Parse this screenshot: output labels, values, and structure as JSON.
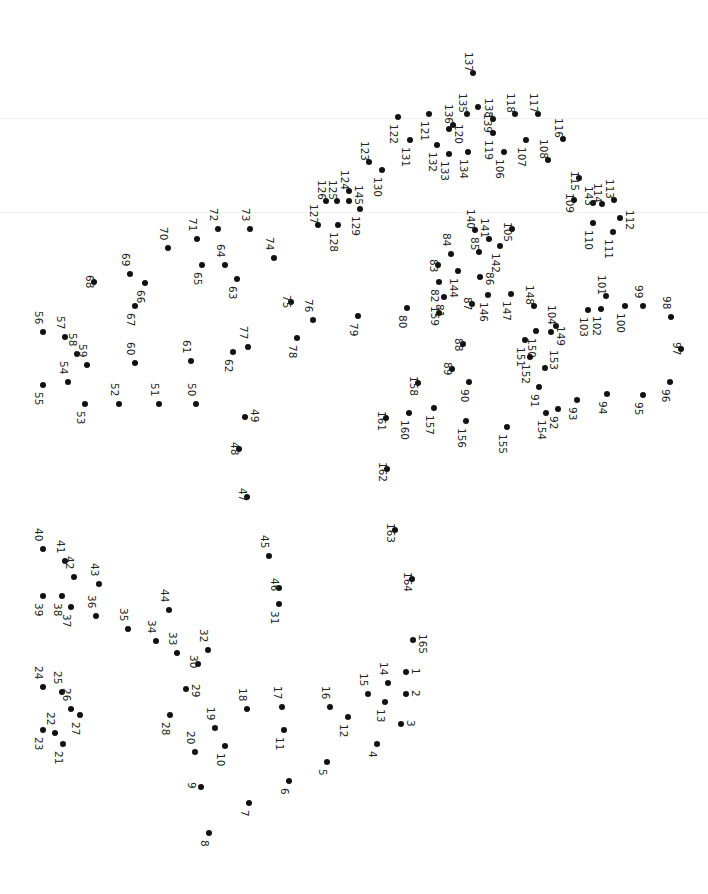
{
  "puzzle": {
    "type": "connect-the-dots",
    "orientation": "rotated-90",
    "dot_color": "#111111",
    "label_color": "#222222",
    "total_dots": 165,
    "dots": [
      {
        "n": 1,
        "x": 406,
        "y": 672,
        "lx": 412,
        "ly": 668
      },
      {
        "n": 2,
        "x": 406,
        "y": 694,
        "lx": 412,
        "ly": 690
      },
      {
        "n": 3,
        "x": 401,
        "y": 724,
        "lx": 407,
        "ly": 720
      },
      {
        "n": 4,
        "x": 377,
        "y": 744,
        "lx": 369,
        "ly": 751
      },
      {
        "n": 5,
        "x": 327,
        "y": 762,
        "lx": 319,
        "ly": 769
      },
      {
        "n": 6,
        "x": 289,
        "y": 781,
        "lx": 281,
        "ly": 788
      },
      {
        "n": 7,
        "x": 249,
        "y": 803,
        "lx": 241,
        "ly": 810
      },
      {
        "n": 8,
        "x": 209,
        "y": 833,
        "lx": 201,
        "ly": 840
      },
      {
        "n": 9,
        "x": 201,
        "y": 787,
        "lx": 188,
        "ly": 782
      },
      {
        "n": 10,
        "x": 225,
        "y": 746,
        "lx": 217,
        "ly": 753
      },
      {
        "n": 11,
        "x": 284,
        "y": 730,
        "lx": 276,
        "ly": 737
      },
      {
        "n": 12,
        "x": 348,
        "y": 717,
        "lx": 340,
        "ly": 724
      },
      {
        "n": 13,
        "x": 385,
        "y": 702,
        "lx": 377,
        "ly": 709
      },
      {
        "n": 14,
        "x": 388,
        "y": 683,
        "lx": 380,
        "ly": 662
      },
      {
        "n": 15,
        "x": 368,
        "y": 694,
        "lx": 360,
        "ly": 673
      },
      {
        "n": 16,
        "x": 330,
        "y": 707,
        "lx": 322,
        "ly": 686
      },
      {
        "n": 17,
        "x": 282,
        "y": 707,
        "lx": 274,
        "ly": 686
      },
      {
        "n": 18,
        "x": 247,
        "y": 709,
        "lx": 239,
        "ly": 688
      },
      {
        "n": 19,
        "x": 215,
        "y": 728,
        "lx": 207,
        "ly": 707
      },
      {
        "n": 20,
        "x": 195,
        "y": 752,
        "lx": 187,
        "ly": 731
      },
      {
        "n": 21,
        "x": 63,
        "y": 744,
        "lx": 55,
        "ly": 751
      },
      {
        "n": 22,
        "x": 55,
        "y": 733,
        "lx": 47,
        "ly": 712
      },
      {
        "n": 23,
        "x": 43,
        "y": 730,
        "lx": 35,
        "ly": 737
      },
      {
        "n": 24,
        "x": 43,
        "y": 687,
        "lx": 35,
        "ly": 666
      },
      {
        "n": 25,
        "x": 62,
        "y": 692,
        "lx": 54,
        "ly": 671
      },
      {
        "n": 26,
        "x": 71,
        "y": 709,
        "lx": 63,
        "ly": 688
      },
      {
        "n": 27,
        "x": 80,
        "y": 715,
        "lx": 72,
        "ly": 722
      },
      {
        "n": 28,
        "x": 170,
        "y": 715,
        "lx": 162,
        "ly": 722
      },
      {
        "n": 29,
        "x": 186,
        "y": 689,
        "lx": 192,
        "ly": 684
      },
      {
        "n": 30,
        "x": 198,
        "y": 664,
        "lx": 190,
        "ly": 655
      },
      {
        "n": 31,
        "x": 279,
        "y": 604,
        "lx": 271,
        "ly": 611
      },
      {
        "n": 32,
        "x": 208,
        "y": 650,
        "lx": 200,
        "ly": 629
      },
      {
        "n": 33,
        "x": 177,
        "y": 653,
        "lx": 169,
        "ly": 632
      },
      {
        "n": 34,
        "x": 156,
        "y": 641,
        "lx": 148,
        "ly": 620
      },
      {
        "n": 35,
        "x": 128,
        "y": 629,
        "lx": 120,
        "ly": 608
      },
      {
        "n": 36,
        "x": 96,
        "y": 616,
        "lx": 88,
        "ly": 595
      },
      {
        "n": 37,
        "x": 71,
        "y": 607,
        "lx": 63,
        "ly": 614
      },
      {
        "n": 38,
        "x": 62,
        "y": 596,
        "lx": 54,
        "ly": 603
      },
      {
        "n": 39,
        "x": 43,
        "y": 596,
        "lx": 35,
        "ly": 603
      },
      {
        "n": 40,
        "x": 43,
        "y": 549,
        "lx": 35,
        "ly": 528
      },
      {
        "n": 41,
        "x": 65,
        "y": 561,
        "lx": 57,
        "ly": 540
      },
      {
        "n": 42,
        "x": 74,
        "y": 577,
        "lx": 66,
        "ly": 556
      },
      {
        "n": 43,
        "x": 99,
        "y": 584,
        "lx": 91,
        "ly": 563
      },
      {
        "n": 44,
        "x": 169,
        "y": 610,
        "lx": 161,
        "ly": 589
      },
      {
        "n": 45,
        "x": 269,
        "y": 556,
        "lx": 261,
        "ly": 535
      },
      {
        "n": 46,
        "x": 279,
        "y": 588,
        "lx": 271,
        "ly": 578
      },
      {
        "n": 47,
        "x": 247,
        "y": 497,
        "lx": 239,
        "ly": 488
      },
      {
        "n": 48,
        "x": 239,
        "y": 449,
        "lx": 231,
        "ly": 442
      },
      {
        "n": 49,
        "x": 245,
        "y": 417,
        "lx": 251,
        "ly": 409
      },
      {
        "n": 50,
        "x": 196,
        "y": 404,
        "lx": 188,
        "ly": 383
      },
      {
        "n": 51,
        "x": 159,
        "y": 404,
        "lx": 151,
        "ly": 383
      },
      {
        "n": 52,
        "x": 119,
        "y": 404,
        "lx": 111,
        "ly": 383
      },
      {
        "n": 53,
        "x": 85,
        "y": 404,
        "lx": 77,
        "ly": 411
      },
      {
        "n": 54,
        "x": 68,
        "y": 382,
        "lx": 60,
        "ly": 361
      },
      {
        "n": 55,
        "x": 43,
        "y": 385,
        "lx": 35,
        "ly": 392
      },
      {
        "n": 56,
        "x": 43,
        "y": 332,
        "lx": 35,
        "ly": 311
      },
      {
        "n": 57,
        "x": 65,
        "y": 337,
        "lx": 57,
        "ly": 316
      },
      {
        "n": 58,
        "x": 77,
        "y": 354,
        "lx": 69,
        "ly": 333
      },
      {
        "n": 59,
        "x": 87,
        "y": 365,
        "lx": 79,
        "ly": 344
      },
      {
        "n": 60,
        "x": 135,
        "y": 363,
        "lx": 127,
        "ly": 342
      },
      {
        "n": 61,
        "x": 191,
        "y": 361,
        "lx": 183,
        "ly": 340
      },
      {
        "n": 62,
        "x": 233,
        "y": 352,
        "lx": 225,
        "ly": 359
      },
      {
        "n": 63,
        "x": 237,
        "y": 279,
        "lx": 229,
        "ly": 286
      },
      {
        "n": 64,
        "x": 225,
        "y": 265,
        "lx": 217,
        "ly": 244
      },
      {
        "n": 65,
        "x": 202,
        "y": 265,
        "lx": 194,
        "ly": 272
      },
      {
        "n": 66,
        "x": 145,
        "y": 283,
        "lx": 137,
        "ly": 290
      },
      {
        "n": 67,
        "x": 135,
        "y": 306,
        "lx": 127,
        "ly": 313
      },
      {
        "n": 68,
        "x": 94,
        "y": 282,
        "lx": 86,
        "ly": 275
      },
      {
        "n": 69,
        "x": 130,
        "y": 274,
        "lx": 122,
        "ly": 253
      },
      {
        "n": 70,
        "x": 168,
        "y": 248,
        "lx": 160,
        "ly": 227
      },
      {
        "n": 71,
        "x": 197,
        "y": 239,
        "lx": 189,
        "ly": 218
      },
      {
        "n": 72,
        "x": 218,
        "y": 229,
        "lx": 210,
        "ly": 208
      },
      {
        "n": 73,
        "x": 250,
        "y": 229,
        "lx": 242,
        "ly": 208
      },
      {
        "n": 74,
        "x": 274,
        "y": 258,
        "lx": 266,
        "ly": 237
      },
      {
        "n": 75,
        "x": 291,
        "y": 302,
        "lx": 283,
        "ly": 295
      },
      {
        "n": 76,
        "x": 313,
        "y": 320,
        "lx": 305,
        "ly": 299
      },
      {
        "n": 77,
        "x": 248,
        "y": 347,
        "lx": 240,
        "ly": 326
      },
      {
        "n": 78,
        "x": 297,
        "y": 338,
        "lx": 289,
        "ly": 345
      },
      {
        "n": 79,
        "x": 358,
        "y": 316,
        "lx": 350,
        "ly": 323
      },
      {
        "n": 80,
        "x": 407,
        "y": 308,
        "lx": 399,
        "ly": 315
      },
      {
        "n": 81,
        "x": 444,
        "y": 297,
        "lx": 436,
        "ly": 304
      },
      {
        "n": 82,
        "x": 439,
        "y": 282,
        "lx": 431,
        "ly": 289
      },
      {
        "n": 83,
        "x": 438,
        "y": 265,
        "lx": 430,
        "ly": 259
      },
      {
        "n": 84,
        "x": 451,
        "y": 254,
        "lx": 443,
        "ly": 233
      },
      {
        "n": 85,
        "x": 479,
        "y": 252,
        "lx": 471,
        "ly": 237
      },
      {
        "n": 86,
        "x": 480,
        "y": 277,
        "lx": 486,
        "ly": 272
      },
      {
        "n": 87,
        "x": 472,
        "y": 304,
        "lx": 464,
        "ly": 297
      },
      {
        "n": 88,
        "x": 463,
        "y": 344,
        "lx": 455,
        "ly": 338
      },
      {
        "n": 89,
        "x": 452,
        "y": 369,
        "lx": 444,
        "ly": 362
      },
      {
        "n": 90,
        "x": 469,
        "y": 382,
        "lx": 461,
        "ly": 389
      },
      {
        "n": 91,
        "x": 539,
        "y": 387,
        "lx": 531,
        "ly": 394
      },
      {
        "n": 92,
        "x": 558,
        "y": 409,
        "lx": 550,
        "ly": 416
      },
      {
        "n": 93,
        "x": 577,
        "y": 400,
        "lx": 569,
        "ly": 407
      },
      {
        "n": 94,
        "x": 607,
        "y": 394,
        "lx": 599,
        "ly": 401
      },
      {
        "n": 95,
        "x": 643,
        "y": 395,
        "lx": 635,
        "ly": 402
      },
      {
        "n": 96,
        "x": 670,
        "y": 382,
        "lx": 662,
        "ly": 389
      },
      {
        "n": 97,
        "x": 681,
        "y": 349,
        "lx": 673,
        "ly": 342
      },
      {
        "n": 98,
        "x": 671,
        "y": 317,
        "lx": 663,
        "ly": 296
      },
      {
        "n": 99,
        "x": 643,
        "y": 306,
        "lx": 635,
        "ly": 285
      },
      {
        "n": 100,
        "x": 625,
        "y": 306,
        "lx": 617,
        "ly": 313
      },
      {
        "n": 101,
        "x": 606,
        "y": 296,
        "lx": 598,
        "ly": 275
      },
      {
        "n": 102,
        "x": 601,
        "y": 309,
        "lx": 593,
        "ly": 316
      },
      {
        "n": 103,
        "x": 588,
        "y": 310,
        "lx": 580,
        "ly": 317
      },
      {
        "n": 104,
        "x": 556,
        "y": 326,
        "lx": 548,
        "ly": 305
      },
      {
        "n": 105,
        "x": 512,
        "y": 229,
        "lx": 504,
        "ly": 222
      },
      {
        "n": 106,
        "x": 504,
        "y": 152,
        "lx": 496,
        "ly": 159
      },
      {
        "n": 107,
        "x": 526,
        "y": 140,
        "lx": 518,
        "ly": 147
      },
      {
        "n": 108,
        "x": 548,
        "y": 160,
        "lx": 540,
        "ly": 139
      },
      {
        "n": 109,
        "x": 574,
        "y": 200,
        "lx": 566,
        "ly": 193
      },
      {
        "n": 110,
        "x": 593,
        "y": 223,
        "lx": 585,
        "ly": 230
      },
      {
        "n": 111,
        "x": 613,
        "y": 232,
        "lx": 605,
        "ly": 239
      },
      {
        "n": 112,
        "x": 620,
        "y": 218,
        "lx": 626,
        "ly": 210
      },
      {
        "n": 113,
        "x": 614,
        "y": 200,
        "lx": 606,
        "ly": 179
      },
      {
        "n": 114,
        "x": 602,
        "y": 204,
        "lx": 594,
        "ly": 183
      },
      {
        "n": 115,
        "x": 579,
        "y": 178,
        "lx": 571,
        "ly": 171
      },
      {
        "n": 116,
        "x": 563,
        "y": 139,
        "lx": 555,
        "ly": 118
      },
      {
        "n": 117,
        "x": 538,
        "y": 114,
        "lx": 530,
        "ly": 93
      },
      {
        "n": 118,
        "x": 515,
        "y": 114,
        "lx": 507,
        "ly": 93
      },
      {
        "n": 119,
        "x": 493,
        "y": 133,
        "lx": 485,
        "ly": 140
      },
      {
        "n": 120,
        "x": 449,
        "y": 129,
        "lx": 455,
        "ly": 124
      },
      {
        "n": 121,
        "x": 429,
        "y": 114,
        "lx": 421,
        "ly": 121
      },
      {
        "n": 122,
        "x": 398,
        "y": 117,
        "lx": 390,
        "ly": 124
      },
      {
        "n": 123,
        "x": 369,
        "y": 162,
        "lx": 361,
        "ly": 141
      },
      {
        "n": 124,
        "x": 349,
        "y": 191,
        "lx": 341,
        "ly": 170
      },
      {
        "n": 125,
        "x": 337,
        "y": 201,
        "lx": 329,
        "ly": 180
      },
      {
        "n": 126,
        "x": 326,
        "y": 201,
        "lx": 318,
        "ly": 180
      },
      {
        "n": 127,
        "x": 318,
        "y": 225,
        "lx": 310,
        "ly": 204
      },
      {
        "n": 128,
        "x": 338,
        "y": 225,
        "lx": 330,
        "ly": 232
      },
      {
        "n": 129,
        "x": 360,
        "y": 209,
        "lx": 352,
        "ly": 216
      },
      {
        "n": 130,
        "x": 382,
        "y": 170,
        "lx": 374,
        "ly": 177
      },
      {
        "n": 131,
        "x": 410,
        "y": 140,
        "lx": 402,
        "ly": 147
      },
      {
        "n": 132,
        "x": 437,
        "y": 145,
        "lx": 429,
        "ly": 152
      },
      {
        "n": 133,
        "x": 449,
        "y": 154,
        "lx": 441,
        "ly": 161
      },
      {
        "n": 134,
        "x": 468,
        "y": 152,
        "lx": 460,
        "ly": 159
      },
      {
        "n": 135,
        "x": 467,
        "y": 114,
        "lx": 459,
        "ly": 93
      },
      {
        "n": 136,
        "x": 453,
        "y": 125,
        "lx": 445,
        "ly": 104
      },
      {
        "n": 137,
        "x": 473,
        "y": 73,
        "lx": 465,
        "ly": 52
      },
      {
        "n": 138,
        "x": 493,
        "y": 119,
        "lx": 485,
        "ly": 98
      },
      {
        "n": 139,
        "x": 478,
        "y": 107,
        "lx": 484,
        "ly": 113
      },
      {
        "n": 140,
        "x": 475,
        "y": 230,
        "lx": 467,
        "ly": 209
      },
      {
        "n": 141,
        "x": 489,
        "y": 239,
        "lx": 481,
        "ly": 218
      },
      {
        "n": 142,
        "x": 500,
        "y": 246,
        "lx": 492,
        "ly": 253
      },
      {
        "n": 143,
        "x": 593,
        "y": 203,
        "lx": 585,
        "ly": 186
      },
      {
        "n": 144,
        "x": 458,
        "y": 271,
        "lx": 450,
        "ly": 278
      },
      {
        "n": 145,
        "x": 349,
        "y": 201,
        "lx": 355,
        "ly": 185
      },
      {
        "n": 146,
        "x": 488,
        "y": 295,
        "lx": 480,
        "ly": 302
      },
      {
        "n": 147,
        "x": 511,
        "y": 294,
        "lx": 503,
        "ly": 301
      },
      {
        "n": 148,
        "x": 534,
        "y": 306,
        "lx": 526,
        "ly": 285
      },
      {
        "n": 149,
        "x": 551,
        "y": 332,
        "lx": 557,
        "ly": 326
      },
      {
        "n": 150,
        "x": 536,
        "y": 331,
        "lx": 528,
        "ly": 338
      },
      {
        "n": 151,
        "x": 525,
        "y": 340,
        "lx": 517,
        "ly": 347
      },
      {
        "n": 152,
        "x": 530,
        "y": 357,
        "lx": 522,
        "ly": 364
      },
      {
        "n": 153,
        "x": 545,
        "y": 368,
        "lx": 550,
        "ly": 350
      },
      {
        "n": 154,
        "x": 546,
        "y": 413,
        "lx": 538,
        "ly": 420
      },
      {
        "n": 155,
        "x": 507,
        "y": 427,
        "lx": 499,
        "ly": 434
      },
      {
        "n": 156,
        "x": 466,
        "y": 421,
        "lx": 458,
        "ly": 428
      },
      {
        "n": 157,
        "x": 434,
        "y": 408,
        "lx": 426,
        "ly": 415
      },
      {
        "n": 158,
        "x": 418,
        "y": 383,
        "lx": 410,
        "ly": 376
      },
      {
        "n": 159,
        "x": 439,
        "y": 313,
        "lx": 431,
        "ly": 306
      },
      {
        "n": 160,
        "x": 409,
        "y": 413,
        "lx": 401,
        "ly": 420
      },
      {
        "n": 161,
        "x": 386,
        "y": 418,
        "lx": 378,
        "ly": 411
      },
      {
        "n": 162,
        "x": 387,
        "y": 469,
        "lx": 379,
        "ly": 462
      },
      {
        "n": 163,
        "x": 395,
        "y": 530,
        "lx": 387,
        "ly": 523
      },
      {
        "n": 164,
        "x": 412,
        "y": 579,
        "lx": 404,
        "ly": 572
      },
      {
        "n": 165,
        "x": 413,
        "y": 640,
        "lx": 419,
        "ly": 634
      }
    ]
  }
}
